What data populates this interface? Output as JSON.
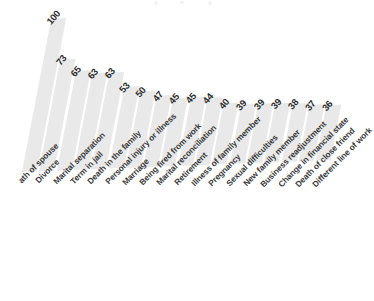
{
  "chart_data": {
    "type": "bar",
    "title": "",
    "subtitle": "",
    "xlabel": "",
    "ylabel": "",
    "ylim": [
      0,
      100
    ],
    "grid": false,
    "legend": null,
    "orientation": "vertical",
    "rotation_note": "entire plot tilted; value labels and category labels rotated about -45 degrees",
    "colors": {
      "bar_fill": "#e9e9e9",
      "value_text": "#2b2b2b",
      "label_text": "#3a3a3a",
      "background": "#ffffff"
    },
    "categories": [
      "Death of spouse",
      "Divorce",
      "Marital separation",
      "Term in jail",
      "Death in the family",
      "Personal injury or illness",
      "Marriage",
      "Being fired from work",
      "Marital reconciliation",
      "Retirement",
      "Illness of family member",
      "Pregnancy",
      "Sexual difficulties",
      "New family member",
      "Business readjustment",
      "Change in financial state",
      "Death of close friend",
      "Different line of work"
    ],
    "values": [
      100,
      73,
      65,
      63,
      63,
      53,
      50,
      47,
      45,
      45,
      44,
      40,
      39,
      39,
      39,
      38,
      37,
      36
    ],
    "value_labels": [
      "100",
      "73",
      "65",
      "63",
      "63",
      "53",
      "50",
      "47",
      "45",
      "45",
      "44",
      "40",
      "39",
      "39",
      "39",
      "38",
      "37",
      "36"
    ],
    "clipped_labels": {
      "Death of spouse": "ath of spouse"
    }
  }
}
